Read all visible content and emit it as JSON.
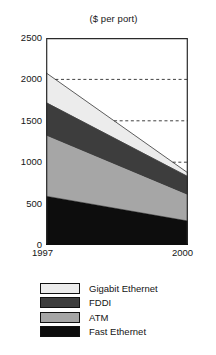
{
  "chart_data": {
    "type": "area",
    "title": "($ per port)",
    "xlabel": "",
    "ylabel": "",
    "x": [
      1997,
      2000
    ],
    "xtick_labels": [
      "1997",
      "2000"
    ],
    "xlim": [
      1997,
      2000
    ],
    "ylim": [
      0,
      2500
    ],
    "ytick_labels": [
      "0",
      "500",
      "1000",
      "1500",
      "2000",
      "2500"
    ],
    "yticks": [
      0,
      500,
      1000,
      1500,
      2000,
      2500
    ],
    "grid": "horizontal dashed gridlines at 1000, 1500 and 2000",
    "gridlines": [
      1000,
      1500,
      2000
    ],
    "stacked": true,
    "legend_position": "below",
    "series": [
      {
        "name": "Fast Ethernet",
        "values": [
          590,
          290
        ],
        "color": "#0d0d0d"
      },
      {
        "name": "ATM",
        "values": [
          730,
          310
        ],
        "color": "#a6a6a6"
      },
      {
        "name": "FDDI",
        "values": [
          400,
          225
        ],
        "color": "#3d3d3d"
      },
      {
        "name": "Gigabit Ethernet",
        "values": [
          360,
          45
        ],
        "color": "#ececec"
      }
    ],
    "cumulative_totals": {
      "Fast Ethernet": [
        590,
        290
      ],
      "ATM": [
        1320,
        600
      ],
      "FDDI": [
        1720,
        825
      ],
      "Gigabit Ethernet": [
        2080,
        870
      ]
    }
  },
  "legend": {
    "items": [
      {
        "label": "Gigabit Ethernet",
        "color": "#ececec"
      },
      {
        "label": "FDDI",
        "color": "#3d3d3d"
      },
      {
        "label": "ATM",
        "color": "#a6a6a6"
      },
      {
        "label": "Fast Ethernet",
        "color": "#0d0d0d"
      }
    ]
  },
  "axes": {
    "y_labels": [
      "2500",
      "2000",
      "1500",
      "1000",
      "500",
      "0"
    ],
    "x_left": "1997",
    "x_right": "2000"
  }
}
